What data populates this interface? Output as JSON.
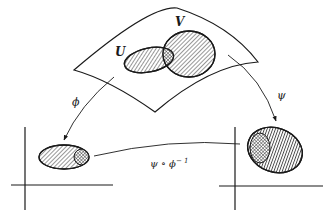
{
  "diagram": {
    "labels": {
      "U": "U",
      "V": "V",
      "phi": "ϕ",
      "psi": "ψ",
      "transition": "ψ ∘ ϕ",
      "transition_exp": "− 1"
    },
    "nodes": [
      {
        "id": "surface",
        "label": "manifold patch"
      },
      {
        "id": "U",
        "label": "U",
        "fill": "diagonal-hatch"
      },
      {
        "id": "V",
        "label": "V",
        "fill": "diagonal-hatch"
      },
      {
        "id": "U_cap_V",
        "label": "U ∩ V",
        "fill": "cross-hatch"
      },
      {
        "id": "phi_image",
        "label": "ϕ(U)",
        "fill": "diagonal-hatch"
      },
      {
        "id": "psi_image",
        "label": "ψ(V)",
        "fill": "vertical-hatch"
      }
    ],
    "edges": [
      {
        "from": "U",
        "to": "phi_image",
        "label": "ϕ"
      },
      {
        "from": "V",
        "to": "psi_image",
        "label": "ψ"
      },
      {
        "from": "phi_image",
        "to": "psi_image",
        "label": "ψ ∘ ϕ⁻¹"
      }
    ],
    "colors": {
      "ink": "#1a1a1a",
      "background": "#ffffff"
    }
  }
}
